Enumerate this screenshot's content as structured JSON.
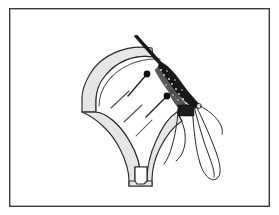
{
  "figure": {
    "caption": "",
    "canvas": {
      "width": 279,
      "height": 215,
      "background": "#ffffff"
    },
    "frame": {
      "name": "outer-border",
      "x": 9,
      "y": 8,
      "width": 261,
      "height": 199,
      "stroke": "#3b3b3b",
      "stroke_width": 1.4,
      "fill": "#ffffff"
    },
    "palette": {
      "ink": "#2b2b2b",
      "band_fill": "#e6e6e6",
      "dark": "#171717",
      "mottle": "#5a5a5a",
      "speck": "#d8d8d8",
      "paper": "#ffffff",
      "dash": "#4a4a4a"
    },
    "elements": [
      {
        "name": "shell-band-outer",
        "label": "fan-shaped outer band",
        "kind": "filled-outline",
        "fill": "#e6e6e6",
        "stroke": "#2b2b2b"
      },
      {
        "name": "shell-band-inner",
        "label": "fan interior",
        "kind": "filled-outline",
        "fill": "#ffffff",
        "stroke": "#2b2b2b"
      },
      {
        "name": "stem-notch",
        "label": "V notch at stem base",
        "kind": "outline"
      },
      {
        "name": "dark-wedge",
        "label": "dark stippled wedge / instrument tip",
        "kind": "filled",
        "fill": "#171717"
      },
      {
        "name": "filament-loops",
        "label": "thin looping filaments",
        "kind": "stroke",
        "count": 2
      }
    ],
    "markers": [
      {
        "name": "pin-marker-1",
        "head_x": 147,
        "head_y": 74,
        "tail_x": 128,
        "tail_y": 96,
        "head_radius": 3.4
      },
      {
        "name": "pin-marker-2",
        "head_x": 167,
        "head_y": 96,
        "tail_x": 146,
        "tail_y": 117,
        "head_radius": 3.4
      }
    ],
    "dashes": [
      {
        "name": "dash-line-1",
        "x1": 111,
        "y1": 108,
        "x2": 129,
        "y2": 91
      },
      {
        "name": "dash-line-2",
        "x1": 124,
        "y1": 122,
        "x2": 142,
        "y2": 105
      },
      {
        "name": "dash-line-3",
        "x1": 136,
        "y1": 136,
        "x2": 152,
        "y2": 120
      }
    ]
  }
}
